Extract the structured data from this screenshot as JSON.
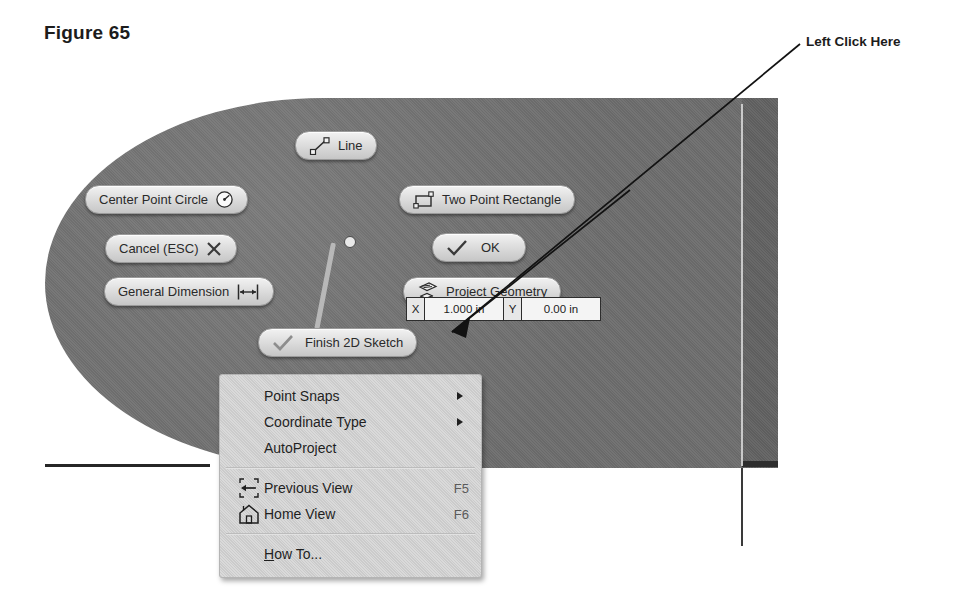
{
  "figure": {
    "title": "Figure 65"
  },
  "callout": {
    "label": "Left Click Here"
  },
  "marking_menu": {
    "buttons": [
      {
        "id": "line",
        "label": "Line",
        "icon": "line-icon",
        "icon_side": "left"
      },
      {
        "id": "center-point-circle",
        "label": "Center Point Circle",
        "icon": "circle-center-icon",
        "icon_side": "right"
      },
      {
        "id": "cancel-esc",
        "label": "Cancel (ESC)",
        "icon": "close-x-icon",
        "icon_side": "right"
      },
      {
        "id": "general-dimension",
        "label": "General Dimension",
        "icon": "dimension-icon",
        "icon_side": "right"
      },
      {
        "id": "two-point-rectangle",
        "label": "Two Point Rectangle",
        "icon": "rectangle-icon",
        "icon_side": "left"
      },
      {
        "id": "ok",
        "label": "OK",
        "icon": "check-icon",
        "icon_side": "left"
      },
      {
        "id": "project-geometry",
        "label": "Project Geometry",
        "icon": "project-geometry-icon",
        "icon_side": "left"
      },
      {
        "id": "finish-sketch",
        "label": "Finish 2D Sketch",
        "icon": "check-icon",
        "icon_side": "left"
      }
    ]
  },
  "coordinate_entry": {
    "x_key": "X",
    "x_value": "1.000 in",
    "y_key": "Y",
    "y_value": "0.00  in"
  },
  "context_menu": {
    "items": [
      {
        "label": "Point Snaps",
        "shortcut": "",
        "icon": "",
        "submenu": true
      },
      {
        "label": "Coordinate Type",
        "shortcut": "",
        "icon": "",
        "submenu": true
      },
      {
        "label": "AutoProject",
        "shortcut": "",
        "icon": "",
        "submenu": false
      },
      {
        "label": "Previous View",
        "shortcut": "F5",
        "icon": "previous-view-icon",
        "submenu": false
      },
      {
        "label": "Home View",
        "shortcut": "F6",
        "icon": "home-view-icon",
        "submenu": false
      },
      {
        "label": "How To...",
        "shortcut": "",
        "icon": "",
        "submenu": false,
        "mnemonic": "H"
      }
    ]
  },
  "colors": {
    "part_face": "#6e6e6e",
    "menu_background": "#cfcfcf",
    "button_face": "#dedede",
    "text": "#1f1f1f",
    "shortcut_text": "#5a5a5a"
  }
}
